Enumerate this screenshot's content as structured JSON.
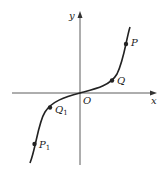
{
  "diagram": {
    "type": "function-graph",
    "axes": {
      "x_label": "x",
      "y_label": "y",
      "origin_label": "O"
    },
    "curve": {
      "description": "cubic-like curve through origin, increasing, inflection at O",
      "color": "#222222"
    },
    "points": [
      {
        "id": "P",
        "label": "P",
        "subscript": ""
      },
      {
        "id": "Q",
        "label": "Q",
        "subscript": ""
      },
      {
        "id": "Q1",
        "label": "Q",
        "subscript": "1"
      },
      {
        "id": "P1",
        "label": "P",
        "subscript": "1"
      }
    ],
    "colors": {
      "axis": "#333333",
      "curve": "#222222",
      "point": "#222222",
      "background": "#ffffff"
    }
  }
}
